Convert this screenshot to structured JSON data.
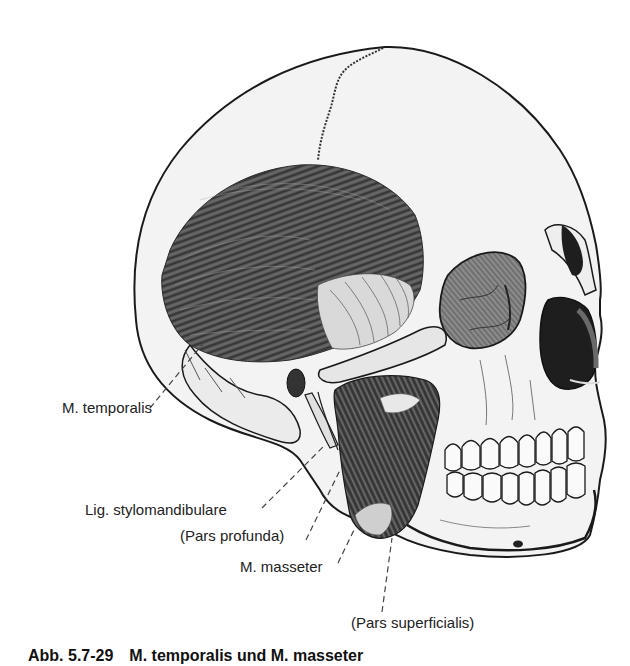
{
  "figure": {
    "labels": {
      "temporalis": "M. temporalis",
      "stylomandibulare": "Lig. stylomandibulare",
      "pars_profunda": "(Pars profunda)",
      "masseter": "M. masseter",
      "pars_superficialis": "(Pars superficialis)"
    },
    "colors": {
      "background": "#ffffff",
      "bone": "#f2f2f2",
      "outline": "#1a1a1a",
      "muscle_dark": "#4a4a4a",
      "muscle_mid": "#6e6e6e",
      "tendon_light": "#d8d8d8",
      "cavity": "#1e1e1e"
    }
  },
  "caption": {
    "number": "Abb. 5.7-29",
    "title": "M. temporalis und M. masseter"
  }
}
